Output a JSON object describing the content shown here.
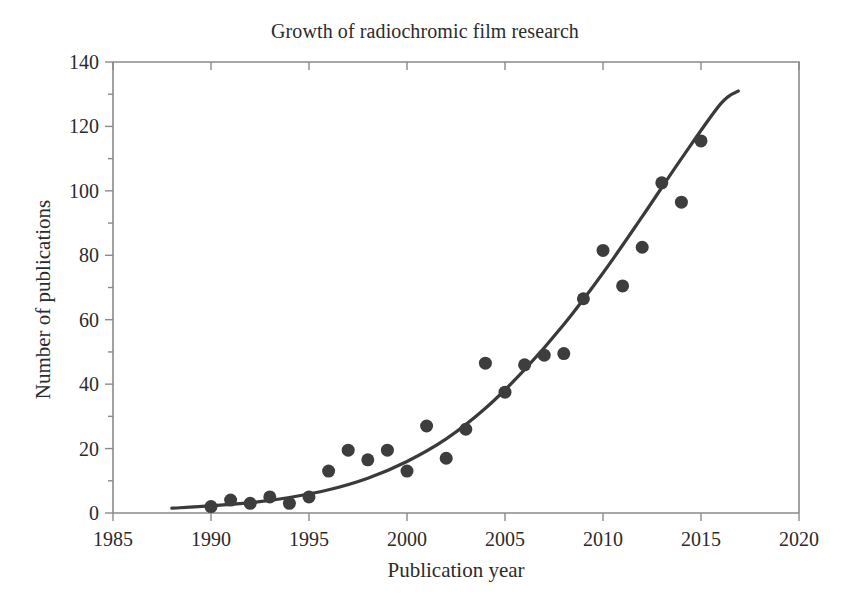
{
  "chart_data": {
    "type": "scatter",
    "title": "Growth of radiochromic film research",
    "xlabel": "Publication year",
    "ylabel": "Number of publications",
    "xlim": [
      1985,
      2020
    ],
    "ylim": [
      0,
      140
    ],
    "xticks": [
      1985,
      1990,
      1995,
      2000,
      2005,
      2010,
      2015,
      2020
    ],
    "yticks": [
      0,
      20,
      40,
      60,
      80,
      100,
      120,
      140
    ],
    "x_minor_tick_interval": 5,
    "y_minor_tick_interval": 10,
    "grid": false,
    "legend": false,
    "marker_color": "#3d3d3d",
    "curve_color": "#3a3a3a",
    "axis_color": "#8a8a8a",
    "background_color": "#ffffff",
    "x": [
      1990,
      1991,
      1992,
      1993,
      1994,
      1995,
      1996,
      1997,
      1998,
      1999,
      2000,
      2001,
      2002,
      2003,
      2004,
      2005,
      2006,
      2007,
      2008,
      2009,
      2010,
      2011,
      2012,
      2013,
      2014,
      2015
    ],
    "values": [
      2,
      4,
      3,
      5,
      3,
      5,
      13,
      19.5,
      16.5,
      19.5,
      13,
      27,
      17,
      26,
      46.5,
      37.5,
      46,
      49,
      49.5,
      66.5,
      81.5,
      70.5,
      82.5,
      102.5,
      96.5,
      115.5
    ],
    "series": [
      {
        "name": "Publications per year",
        "type": "scatter",
        "values": [
          2,
          4,
          3,
          5,
          3,
          5,
          13,
          19.5,
          16.5,
          19.5,
          13,
          27,
          17,
          26,
          46.5,
          37.5,
          46,
          49,
          49.5,
          66.5,
          81.5,
          70.5,
          82.5,
          102.5,
          96.5,
          115.5
        ]
      },
      {
        "name": "Exponential trend fit",
        "type": "line",
        "x": [
          1988,
          1990,
          1992,
          1994,
          1996,
          1998,
          2000,
          2002,
          2004,
          2006,
          2008,
          2010,
          2012,
          2014,
          2016,
          2016.9
        ],
        "values": [
          1.5,
          2.2,
          3.2,
          4.8,
          7.2,
          10.8,
          16.0,
          23.0,
          32.5,
          44.5,
          58.5,
          74.5,
          92.0,
          110.0,
          127.0,
          131.0
        ]
      }
    ]
  },
  "axes": {
    "x_tick_labels": [
      "1985",
      "1990",
      "1995",
      "2000",
      "2005",
      "2010",
      "2015",
      "2020"
    ],
    "y_tick_labels": [
      "0",
      "20",
      "40",
      "60",
      "80",
      "100",
      "120",
      "140"
    ]
  }
}
